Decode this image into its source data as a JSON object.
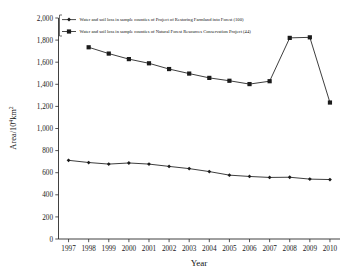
{
  "chart_data": {
    "type": "line",
    "title": "",
    "xlabel": "Year",
    "ylabel": "Area/10⁴km²",
    "ylabel_base": "Area/10",
    "ylabel_exp": "4",
    "ylabel_tail": "km",
    "ylabel_tail_exp": "2",
    "x": [
      1997,
      1998,
      1999,
      2000,
      2001,
      2002,
      2003,
      2004,
      2005,
      2006,
      2007,
      2008,
      2009,
      2010
    ],
    "xtick_labels": [
      "1997",
      "1998",
      "1999",
      "2000",
      "2001",
      "2002",
      "2003",
      "2004",
      "2005",
      "2006",
      "2007",
      "2008",
      "2009",
      "2010"
    ],
    "xlim": [
      1996.5,
      2010.5
    ],
    "ylim": [
      0,
      2000
    ],
    "ytick_values": [
      0,
      200,
      400,
      600,
      800,
      1000,
      1200,
      1400,
      1600,
      1800,
      2000
    ],
    "ytick_labels": [
      "0",
      "200",
      "400",
      "600",
      "800",
      "1,000",
      "1,200",
      "1,400",
      "1,600",
      "1,800",
      "2,000"
    ],
    "grid": false,
    "legend_position": "top-left-inside",
    "series": [
      {
        "name": "Water and soil loss in sample counties of Project of Restoring Farmland into Forest (100)",
        "marker": "diamond",
        "color": "#1b1b1b",
        "x": [
          1997,
          1998,
          1999,
          2000,
          2001,
          2002,
          2003,
          2004,
          2005,
          2006,
          2007,
          2008,
          2009,
          2010
        ],
        "values": [
          712,
          692,
          678,
          688,
          678,
          657,
          637,
          610,
          578,
          566,
          557,
          559,
          542,
          538
        ]
      },
      {
        "name": "Water and soil loss in sample counties of Natural Forest Resources Conservation Project (44)",
        "marker": "square",
        "color": "#1b1b1b",
        "x": [
          1998,
          1999,
          2000,
          2001,
          2002,
          2003,
          2004,
          2005,
          2006,
          2007,
          2008,
          2009,
          2010
        ],
        "values": [
          1735,
          1678,
          1628,
          1590,
          1538,
          1497,
          1458,
          1432,
          1402,
          1428,
          1820,
          1825,
          1235
        ]
      }
    ]
  },
  "legend": {
    "entries": [
      {
        "label": "Water and soil loss in sample counties of Project of Restoring Farmland into Forest (100)",
        "marker": "diamond"
      },
      {
        "label": "Water and soil loss in sample counties of Natural Forest Resources Conservation Project (44)",
        "marker": "square"
      }
    ]
  },
  "axes": {
    "x_title": "Year",
    "y_title": "Area/10⁴km²"
  }
}
